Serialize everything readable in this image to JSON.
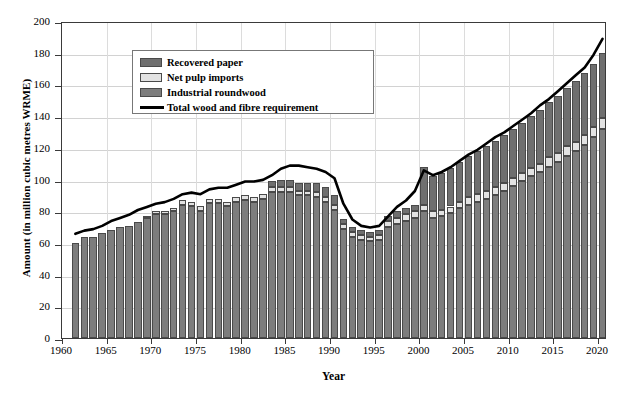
{
  "chart_data": {
    "type": "bar",
    "stacked": true,
    "title": "",
    "xlabel": "Year",
    "ylabel": "Amount (in million cubic metres WRME)",
    "xlim": [
      1960,
      2020
    ],
    "ylim": [
      0,
      200
    ],
    "ytick_step": 20,
    "xtick_step": 5,
    "grid": true,
    "legend_position": "top-left",
    "ytick_labels": [
      "0",
      "20",
      "40",
      "60",
      "80",
      "100",
      "120",
      "140",
      "160",
      "180",
      "200"
    ],
    "xtick_labels": [
      "1960",
      "1965",
      "1970",
      "1975",
      "1980",
      "1985",
      "1990",
      "1995",
      "2000",
      "2005",
      "2010",
      "2015",
      "2020"
    ],
    "legend": [
      {
        "name": "Recovered paper",
        "type": "bar",
        "color": "#6f6f6f"
      },
      {
        "name": "Net pulp imports",
        "type": "bar",
        "color": "#e2e2e2"
      },
      {
        "name": "Industrial roundwood",
        "type": "bar",
        "color": "#7d7d7d"
      },
      {
        "name": "Total wood and fibre requirement",
        "type": "line",
        "color": "#000000"
      }
    ],
    "x": [
      1961,
      1962,
      1963,
      1964,
      1965,
      1966,
      1967,
      1968,
      1969,
      1970,
      1971,
      1972,
      1973,
      1974,
      1975,
      1976,
      1977,
      1978,
      1979,
      1980,
      1981,
      1982,
      1983,
      1984,
      1985,
      1986,
      1987,
      1988,
      1989,
      1990,
      1991,
      1992,
      1993,
      1994,
      1995,
      1996,
      1997,
      1998,
      1999,
      2000,
      2001,
      2002,
      2003,
      2004,
      2005,
      2006,
      2007,
      2008,
      2009,
      2010,
      2011,
      2012,
      2013,
      2014,
      2015,
      2016,
      2017,
      2018,
      2019,
      2020
    ],
    "series": [
      {
        "name": "Industrial roundwood",
        "color": "#7d7d7d",
        "values": [
          60,
          64,
          64,
          66,
          68,
          70,
          71,
          73,
          76,
          78,
          78,
          80,
          84,
          83,
          80,
          85,
          85,
          83,
          86,
          87,
          86,
          88,
          92,
          92,
          92,
          90,
          90,
          89,
          86,
          81,
          69,
          64,
          62,
          61,
          62,
          70,
          72,
          74,
          76,
          80,
          76,
          77,
          79,
          82,
          84,
          86,
          88,
          90,
          93,
          96,
          99,
          102,
          105,
          108,
          111,
          115,
          118,
          122,
          127,
          132
        ]
      },
      {
        "name": "Net pulp imports",
        "color": "#e2e2e2",
        "values": [
          0,
          0,
          0,
          0,
          0,
          0,
          0,
          0,
          1,
          2,
          2,
          2,
          3,
          3,
          3,
          3,
          3,
          3,
          3,
          3,
          3,
          3,
          3,
          3,
          3,
          3,
          3,
          3,
          3,
          3,
          3,
          3,
          3,
          3,
          3,
          4,
          4,
          4,
          4,
          4,
          4,
          4,
          4,
          4,
          5,
          5,
          5,
          5,
          5,
          5,
          5,
          5,
          5,
          6,
          6,
          6,
          6,
          6,
          6,
          7
        ]
      },
      {
        "name": "Recovered paper",
        "color": "#6f6f6f",
        "values": [
          0,
          0,
          0,
          0,
          0,
          0,
          0,
          0,
          0,
          0,
          0,
          0,
          0,
          0,
          0,
          0,
          0,
          0,
          0,
          0,
          0,
          0,
          4,
          5,
          5,
          5,
          5,
          6,
          6,
          6,
          3,
          3,
          3,
          3,
          3,
          3,
          4,
          4,
          4,
          24,
          22,
          23,
          24,
          25,
          26,
          27,
          28,
          29,
          30,
          31,
          32,
          33,
          34,
          35,
          36,
          37,
          38,
          39,
          40,
          41
        ]
      }
    ],
    "line_series": {
      "name": "Total wood and fibre requirement",
      "color": "#000000",
      "values": [
        67,
        69,
        70,
        72,
        75,
        77,
        79,
        82,
        84,
        86,
        87,
        89,
        92,
        93,
        92,
        95,
        96,
        96,
        98,
        100,
        100,
        101,
        104,
        108,
        110,
        110,
        109,
        108,
        106,
        102,
        86,
        76,
        72,
        71,
        72,
        78,
        84,
        88,
        94,
        107,
        104,
        106,
        109,
        113,
        117,
        120,
        124,
        128,
        131,
        135,
        139,
        143,
        148,
        152,
        157,
        162,
        167,
        172,
        180,
        190
      ]
    }
  },
  "legend_labels": {
    "recovered_paper": "Recovered paper",
    "net_pulp_imports": "Net pulp imports",
    "industrial_roundwood": "Industrial roundwood",
    "total_line": "Total wood and fibre requirement"
  },
  "axes": {
    "ylabel": "Amount (in million cubic metres WRME)",
    "xlabel": "Year"
  }
}
